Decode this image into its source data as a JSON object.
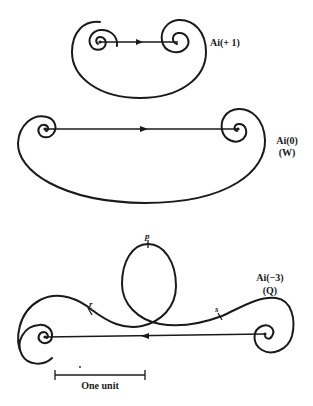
{
  "figures": [
    {
      "id": "top",
      "label": "Ai(+ 1)",
      "sublabel": "",
      "arrow_direction": "right"
    },
    {
      "id": "middle",
      "label": "Ai(0)",
      "sublabel": "(W)",
      "arrow_direction": "right"
    },
    {
      "id": "bottom",
      "label": "Ai(−3)",
      "sublabel": "(Q)",
      "arrow_direction": "left",
      "points": {
        "p": "p",
        "r": "r",
        "s": "s"
      }
    }
  ],
  "scale_bar": {
    "label": "One unit"
  },
  "colors": {
    "ink": "#1a1a1a",
    "background": "#ffffff"
  }
}
